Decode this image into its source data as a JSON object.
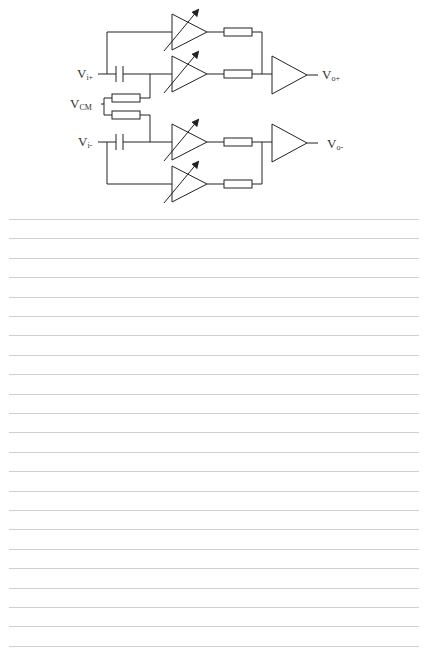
{
  "diagram": {
    "labels": {
      "vi_plus": {
        "base": "V",
        "sub": "i+"
      },
      "vi_minus": {
        "base": "V",
        "sub": "i-"
      },
      "vcm": {
        "base": "V",
        "sub": "CM"
      },
      "vo_plus": {
        "base": "V",
        "sub": "o+"
      },
      "vo_minus": {
        "base": "V",
        "sub": "o-"
      }
    },
    "stroke_color": "#222222"
  },
  "ruled_lines": {
    "count": 23,
    "first_y": 219,
    "spacing": 19.4,
    "color": "#cfcfcf"
  }
}
